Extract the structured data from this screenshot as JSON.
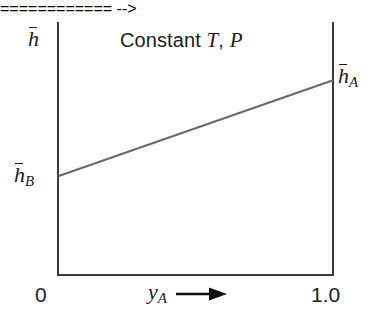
{
  "figure": {
    "background_color": "#ffffff",
    "width": 372,
    "height": 322
  },
  "title": {
    "prefix": "Constant",
    "variable_t": "T",
    "separator": ",",
    "variable_p": "P",
    "full_text": "Constant T, P"
  },
  "axes": {
    "y_symbol_base": "h",
    "y_symbol_full": "h̄",
    "x_symbol_base": "y",
    "x_symbol_subscript": "A",
    "x_symbol_full": "y_A",
    "x_arrow": "arrow-right",
    "frame_color": "#3a3a3a",
    "x_ticks": [
      "0",
      "1.0"
    ],
    "x_tick_left": "0",
    "x_tick_right": "1.0"
  },
  "annotations": {
    "left_intercept_base": "h",
    "left_intercept_subscript": "B",
    "left_intercept_full": "h̄_B",
    "right_intercept_base": "h",
    "right_intercept_subscript": "A",
    "right_intercept_full": "h̄_A"
  },
  "chart_data": {
    "type": "line",
    "xlabel": "y_A",
    "ylabel": "h̄",
    "xlim": [
      0,
      1.0
    ],
    "ylim": [
      0,
      1.0
    ],
    "grid": false,
    "legend": null,
    "line_color": "#6a6a6a",
    "line_width": 2,
    "x_tick_labels": [
      "0",
      "1.0"
    ],
    "x_tick_values": [
      0,
      1.0
    ],
    "y_tick_labels": [
      "h̄_B",
      "h̄_A"
    ],
    "series": [
      {
        "name": "ideal-solution enthalpy",
        "x": [
          0,
          1.0
        ],
        "y": [
          0.39,
          0.77
        ],
        "endpoint_labels": [
          "h̄_B",
          "h̄_A"
        ]
      }
    ],
    "annotations": [
      {
        "text": "h̄_B",
        "x": 0,
        "y": 0.39,
        "position": "left-outside"
      },
      {
        "text": "h̄_A",
        "x": 1.0,
        "y": 0.77,
        "position": "right-outside"
      },
      {
        "text": "Constant T, P",
        "x": 0.45,
        "y": 0.95,
        "position": "inside-top"
      }
    ]
  }
}
